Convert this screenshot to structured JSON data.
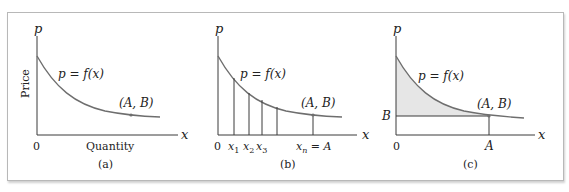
{
  "figure": {
    "panels": [
      {
        "id": "a",
        "caption": "(a)",
        "y_axis_label": "p",
        "x_axis_label": "x",
        "y_axis_title": "Price",
        "x_axis_title": "Quantity",
        "origin_label": "0",
        "curve_label": "p = f(x)",
        "point_label": "(A, B)"
      },
      {
        "id": "b",
        "caption": "(b)",
        "y_axis_label": "p",
        "x_axis_label": "x",
        "origin_label": "0",
        "curve_label": "p = f(x)",
        "point_label": "(A, B)",
        "tick_labels": [
          "x1",
          "x2",
          "x3",
          "xn = A"
        ]
      },
      {
        "id": "c",
        "caption": "(c)",
        "y_axis_label": "p",
        "x_axis_label": "x",
        "origin_label": "0",
        "curve_label": "p = f(x)",
        "point_label": "(A, B)",
        "y_tick_label": "B",
        "x_tick_label": "A"
      }
    ],
    "colors": {
      "curve": "#6e6e6e",
      "axis": "#3a3a3a",
      "shading": "#e6e6e6",
      "frame": "#b8b8b8"
    }
  }
}
